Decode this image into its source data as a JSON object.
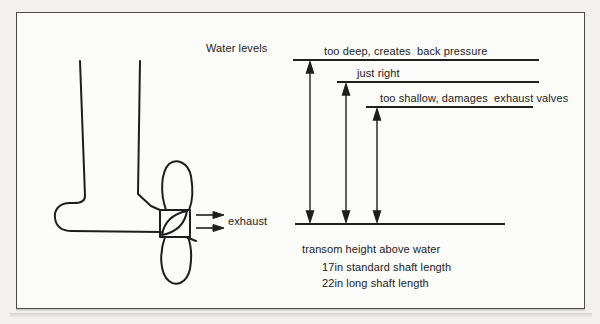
{
  "figure": {
    "title": "Water levels",
    "water_levels": [
      {
        "label": "too deep, creates  back pressure"
      },
      {
        "label": "just right"
      },
      {
        "label": "too shallow, damages  exhaust valves"
      }
    ],
    "baseline": {
      "label": "transom height above water"
    },
    "shaft_notes": [
      {
        "text": "17in standard shaft length"
      },
      {
        "text": "22in long shaft length"
      }
    ],
    "exhaust": {
      "label": "exhaust"
    },
    "colors": {
      "ink": "#222222",
      "paper": "#fcfcfa",
      "page_bg": "#f2f1ee"
    }
  }
}
